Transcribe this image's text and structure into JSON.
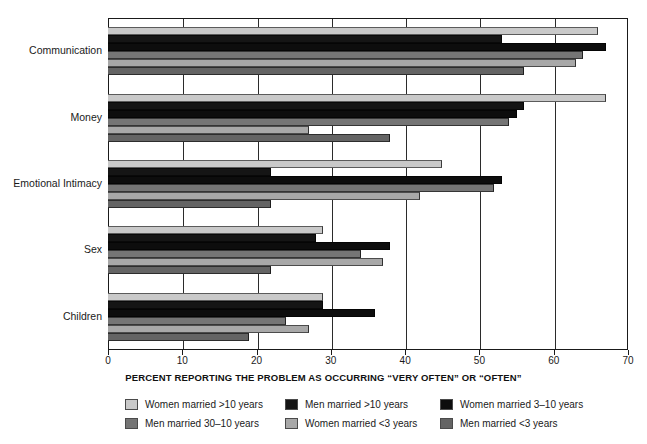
{
  "chart_data": {
    "type": "bar",
    "orientation": "horizontal",
    "title": "",
    "xlabel": "PERCENT REPORTING THE PROBLEM AS OCCURRING “VERY OFTEN” OR “OFTEN”",
    "ylabel": "",
    "xlim": [
      0,
      70
    ],
    "xticks": [
      0,
      10,
      20,
      30,
      40,
      50,
      60,
      70
    ],
    "xticklabels": [
      "0",
      "10",
      "20",
      "30",
      "40",
      "50",
      "60",
      "70"
    ],
    "grid": true,
    "grid_axis": "x",
    "legend_position": "bottom",
    "categories": [
      "Communication",
      "Money",
      "Emotional Intimacy",
      "Sex",
      "Children"
    ],
    "series": [
      {
        "name": "Women married >10 years",
        "color": "#c9c9c9",
        "values": [
          66,
          67,
          45,
          29,
          29
        ]
      },
      {
        "name": "Men married >10 years",
        "color": "#151515",
        "values": [
          53,
          56,
          22,
          28,
          29
        ]
      },
      {
        "name": "Women married 3–10 years",
        "color": "#0d0d0d",
        "values": [
          67,
          55,
          53,
          38,
          36
        ]
      },
      {
        "name": "Men married 30–10 years",
        "color": "#757575",
        "values": [
          64,
          54,
          52,
          34,
          24
        ]
      },
      {
        "name": "Women married <3 years",
        "color": "#a8a8a8",
        "values": [
          63,
          27,
          42,
          37,
          27
        ]
      },
      {
        "name": "Men married <3 years",
        "color": "#646464",
        "values": [
          56,
          38,
          22,
          22,
          19
        ]
      }
    ]
  },
  "axis": {
    "tick_labels": [
      "0",
      "10",
      "20",
      "30",
      "40",
      "50",
      "60",
      "70"
    ],
    "title": "PERCENT REPORTING THE PROBLEM AS OCCURRING “VERY OFTEN” OR “OFTEN”"
  },
  "categories": [
    {
      "label": "Communication"
    },
    {
      "label": "Money"
    },
    {
      "label": "Emotional Intimacy"
    },
    {
      "label": "Sex"
    },
    {
      "label": "Children"
    }
  ],
  "legend": {
    "columns": [
      {
        "items": [
          {
            "label": "Women married >10 years",
            "color": "#c9c9c9"
          },
          {
            "label": "Men married 30–10 years",
            "color": "#757575"
          }
        ]
      },
      {
        "items": [
          {
            "label": "Men married >10 years",
            "color": "#151515"
          },
          {
            "label": "Women married <3 years",
            "color": "#a8a8a8"
          }
        ]
      },
      {
        "items": [
          {
            "label": "Women married 3–10 years",
            "color": "#0d0d0d"
          },
          {
            "label": "Men married <3 years",
            "color": "#646464"
          }
        ]
      }
    ]
  }
}
